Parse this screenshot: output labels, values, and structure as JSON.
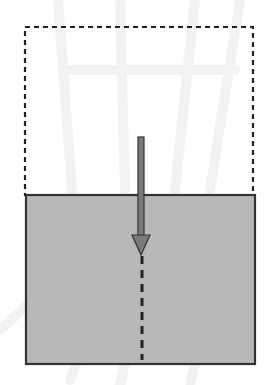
{
  "diagram": {
    "colors": {
      "background": "#ffffff",
      "fill": "#b8b8b8",
      "outline": "#333333",
      "dashed_outline": "#222222",
      "arrow_fill": "#7a7a7a",
      "arrow_stroke": "#333333",
      "watermark": "#f1f1f1"
    },
    "dashed_box": {
      "x": 25,
      "y": 27,
      "width": 228,
      "height": 168
    },
    "solid_box": {
      "x": 26,
      "y": 195,
      "width": 229,
      "height": 169
    },
    "arrow": {
      "x": 141,
      "y_start": 137,
      "y_head_tip": 255,
      "head_width": 18,
      "shaft_width": 6
    },
    "dashed_line": {
      "x": 142,
      "y_start": 256,
      "y_end": 360
    }
  }
}
